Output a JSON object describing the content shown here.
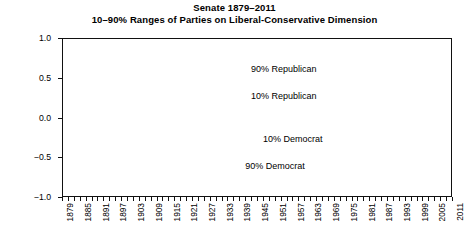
{
  "title": {
    "line1": "Senate 1879–2011",
    "line2": "10–90% Ranges of Parties on Liberal-Conservative Dimension"
  },
  "axes": {
    "ylabel": "Liberal-Conservative",
    "yticks": [
      "1.0",
      "0.5",
      "0.0",
      "-0.5",
      "-1.0"
    ],
    "ytick_values": [
      1.0,
      0.5,
      0.0,
      -0.5,
      -1.0
    ],
    "gridlines": [
      1.0,
      0.75,
      0.5,
      0.25,
      0.0,
      -0.25,
      -0.5,
      -0.75,
      -1.0
    ],
    "xticks": [
      "1879",
      "1885",
      "1891",
      "1897",
      "1903",
      "1909",
      "1915",
      "1921",
      "1927",
      "1933",
      "1939",
      "1945",
      "1951",
      "1957",
      "1963",
      "1969",
      "1975",
      "1981",
      "1987",
      "1993",
      "1999",
      "2005",
      "2011"
    ]
  },
  "annotations": [
    {
      "text": "90% Republican",
      "x": 1943,
      "y": 0.6
    },
    {
      "text": "10% Republican",
      "x": 1943,
      "y": 0.26
    },
    {
      "text": "10% Democrat",
      "x": 1947,
      "y": -0.28
    },
    {
      "text": "90% Democrat",
      "x": 1941,
      "y": -0.62
    }
  ],
  "colors": {
    "series_dark": "#111111",
    "series_gray": "#8a8a8a",
    "grid": "#909090",
    "frame": "#111111",
    "background": "#ffffff"
  },
  "chart_data": {
    "type": "line",
    "xlabel": "",
    "ylabel": "Liberal-Conservative",
    "xlim": [
      1879,
      2011
    ],
    "ylim": [
      -1.0,
      1.0
    ],
    "grid": true,
    "legend": "inline-annotations",
    "marker": "filled-circle",
    "x": [
      1879,
      1881,
      1883,
      1885,
      1887,
      1889,
      1891,
      1893,
      1895,
      1897,
      1899,
      1901,
      1903,
      1905,
      1907,
      1909,
      1911,
      1913,
      1915,
      1917,
      1919,
      1921,
      1923,
      1925,
      1927,
      1929,
      1931,
      1933,
      1935,
      1937,
      1939,
      1941,
      1943,
      1945,
      1947,
      1949,
      1951,
      1953,
      1955,
      1957,
      1959,
      1961,
      1963,
      1965,
      1967,
      1969,
      1971,
      1973,
      1975,
      1977,
      1979,
      1981,
      1983,
      1985,
      1987,
      1989,
      1991,
      1993,
      1995,
      1997,
      1999,
      2001,
      2003,
      2005,
      2007,
      2009,
      2011
    ],
    "series": [
      {
        "name": "90% Republican",
        "color": "#111111",
        "values": [
          0.33,
          0.33,
          0.32,
          0.31,
          0.3,
          0.29,
          0.31,
          0.33,
          0.36,
          0.39,
          0.42,
          0.46,
          0.45,
          0.48,
          0.5,
          0.52,
          0.51,
          0.53,
          0.56,
          0.6,
          0.64,
          0.66,
          0.66,
          0.65,
          0.62,
          0.59,
          0.56,
          0.54,
          0.52,
          0.5,
          0.47,
          0.43,
          0.4,
          0.36,
          0.33,
          0.31,
          0.34,
          0.37,
          0.38,
          0.39,
          0.38,
          0.39,
          0.4,
          0.42,
          0.43,
          0.44,
          0.46,
          0.49,
          0.46,
          0.45,
          0.46,
          0.47,
          0.48,
          0.49,
          0.5,
          0.51,
          0.52,
          0.52,
          0.53,
          0.53,
          0.54,
          0.55,
          0.56,
          0.58,
          0.62,
          0.67,
          0.74
        ]
      },
      {
        "name": "10% Republican",
        "color": "#8a8a8a",
        "values": [
          0.2,
          0.2,
          0.2,
          0.2,
          0.19,
          0.19,
          0.19,
          0.18,
          0.18,
          0.18,
          0.12,
          0.06,
          0.16,
          0.17,
          0.13,
          0.11,
          0.17,
          0.19,
          0.17,
          0.14,
          0.1,
          0.06,
          0.07,
          0.1,
          0.13,
          0.16,
          0.16,
          0.16,
          0.18,
          0.18,
          0.17,
          0.18,
          0.19,
          0.17,
          0.16,
          0.15,
          0.16,
          0.15,
          0.14,
          0.14,
          0.13,
          0.12,
          0.13,
          0.11,
          0.09,
          0.07,
          0.08,
          0.09,
          0.06,
          0.03,
          0.07,
          0.09,
          0.1,
          0.11,
          0.11,
          0.1,
          0.1,
          0.11,
          0.11,
          0.12,
          0.2,
          0.13,
          0.15,
          0.17,
          0.18,
          0.2,
          0.28
        ]
      },
      {
        "name": "10% Democrat",
        "color": "#111111",
        "values": [
          -0.47,
          -0.47,
          -0.48,
          -0.47,
          -0.46,
          -0.46,
          -0.45,
          -0.42,
          -0.36,
          -0.31,
          -0.3,
          -0.29,
          -0.31,
          -0.31,
          -0.31,
          -0.31,
          -0.3,
          -0.3,
          -0.29,
          -0.27,
          -0.25,
          -0.22,
          -0.19,
          -0.17,
          -0.16,
          -0.15,
          -0.14,
          -0.13,
          -0.12,
          -0.11,
          -0.1,
          -0.09,
          -0.08,
          -0.08,
          -0.07,
          -0.08,
          -0.09,
          -0.1,
          -0.11,
          -0.12,
          -0.12,
          -0.12,
          -0.13,
          -0.13,
          -0.13,
          -0.12,
          -0.14,
          -0.18,
          -0.19,
          -0.16,
          -0.15,
          -0.14,
          -0.14,
          -0.15,
          -0.16,
          -0.18,
          -0.2,
          -0.24,
          -0.27,
          -0.29,
          -0.29,
          -0.28,
          -0.28,
          -0.28,
          -0.27,
          -0.27,
          -0.27
        ]
      },
      {
        "name": "90% Democrat",
        "color": "#111111",
        "values": [
          -0.78,
          -0.78,
          -0.79,
          -0.8,
          -0.8,
          -0.8,
          -0.78,
          -0.77,
          -0.76,
          -0.75,
          -0.75,
          -0.75,
          -0.74,
          -0.73,
          -0.73,
          -0.73,
          -0.64,
          -0.71,
          -0.66,
          -0.61,
          -0.58,
          -0.57,
          -0.57,
          -0.56,
          -0.56,
          -0.55,
          -0.55,
          -0.56,
          -0.56,
          -0.55,
          -0.54,
          -0.53,
          -0.51,
          -0.49,
          -0.49,
          -0.5,
          -0.5,
          -0.51,
          -0.51,
          -0.5,
          -0.55,
          -0.55,
          -0.56,
          -0.59,
          -0.61,
          -0.6,
          -0.57,
          -0.55,
          -0.53,
          -0.52,
          -0.51,
          -0.49,
          -0.49,
          -0.48,
          -0.48,
          -0.47,
          -0.47,
          -0.47,
          -0.46,
          -0.46,
          -0.46,
          -0.46,
          -0.46,
          -0.46,
          -0.45,
          -0.45,
          -0.45
        ]
      }
    ]
  }
}
